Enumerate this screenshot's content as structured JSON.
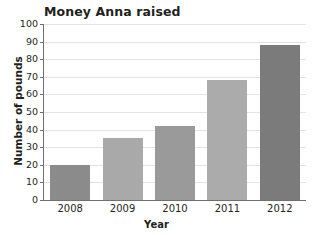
{
  "chart_data": {
    "type": "bar",
    "title": "Money Anna raised",
    "xlabel": "Year",
    "ylabel": "Number of pounds",
    "categories": [
      "2008",
      "2009",
      "2010",
      "2011",
      "2012"
    ],
    "values": [
      20,
      35,
      42,
      68,
      88
    ],
    "ylim": [
      0,
      100
    ],
    "ytick_labels": [
      "100",
      "90",
      "80",
      "70",
      "60",
      "50",
      "40",
      "30",
      "20",
      "10",
      "0"
    ],
    "ytick_values": [
      100,
      90,
      80,
      70,
      60,
      50,
      40,
      30,
      20,
      10,
      0
    ],
    "ytick_step": 10,
    "grid": "horizontal",
    "legend": "none",
    "bar_colors": [
      "#8b8b8b",
      "#a9a9a9",
      "#9a9a9a",
      "#ababab",
      "#7b7b7b"
    ],
    "gridline_color": "#e3e3e3",
    "axis_color": "#6f6f6f",
    "text_color": "#231f20",
    "background_color": "#ffffff"
  }
}
